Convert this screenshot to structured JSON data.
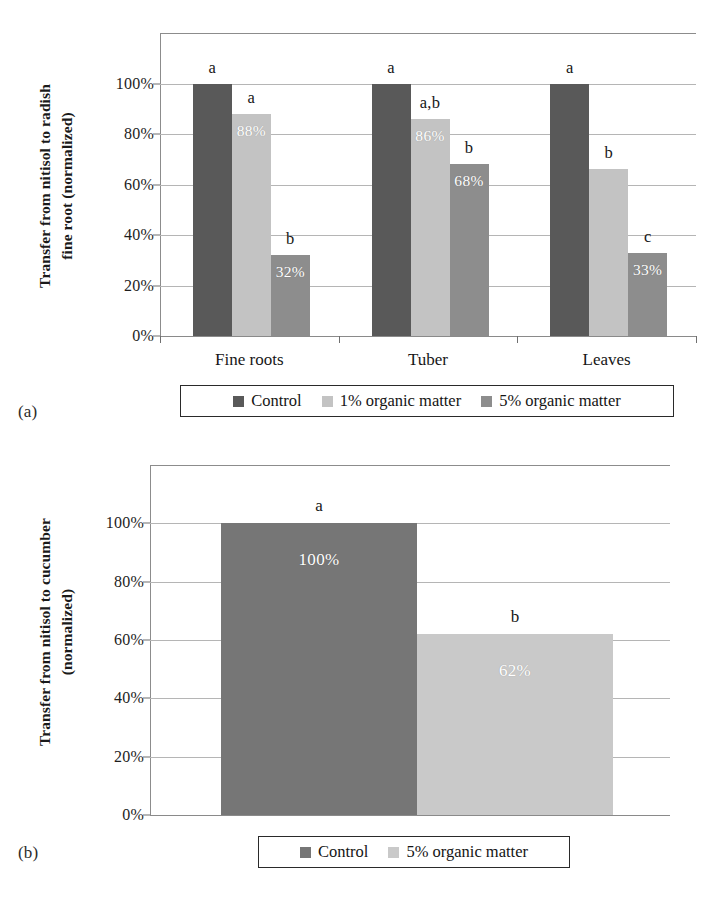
{
  "figure": {
    "panels": [
      {
        "tag": "(a)"
      },
      {
        "tag": "(b)"
      }
    ]
  },
  "panel_a": {
    "tag": "(a)",
    "y_axis_title": "Transfer from nitisol to radish\nfine root (normalized)",
    "y_ticks": [
      "100%",
      "80%",
      "60%",
      "40%",
      "20%",
      "0%"
    ],
    "categories": [
      "Fine roots",
      "Tuber",
      "Leaves"
    ],
    "legend": [
      {
        "label": "Control",
        "color": "#595959"
      },
      {
        "label": "1% organic matter",
        "color": "#c3c3c3"
      },
      {
        "label": "5% organic matter",
        "color": "#8d8d8d"
      }
    ],
    "bars": [
      {
        "group": "Fine roots",
        "series": "Control",
        "value": 100,
        "value_label": "",
        "sig": "a"
      },
      {
        "group": "Fine roots",
        "series": "1% organic matter",
        "value": 88,
        "value_label": "88%",
        "sig": "a"
      },
      {
        "group": "Fine roots",
        "series": "5% organic matter",
        "value": 32,
        "value_label": "32%",
        "sig": "b"
      },
      {
        "group": "Tuber",
        "series": "Control",
        "value": 100,
        "value_label": "",
        "sig": "a"
      },
      {
        "group": "Tuber",
        "series": "1% organic matter",
        "value": 86,
        "value_label": "86%",
        "sig": "a,b"
      },
      {
        "group": "Tuber",
        "series": "5% organic matter",
        "value": 68,
        "value_label": "68%",
        "sig": "b"
      },
      {
        "group": "Leaves",
        "series": "Control",
        "value": 100,
        "value_label": "",
        "sig": "a"
      },
      {
        "group": "Leaves",
        "series": "1% organic matter",
        "value": 66,
        "value_label": "",
        "sig": "b"
      },
      {
        "group": "Leaves",
        "series": "5% organic matter",
        "value": 33,
        "value_label": "33%",
        "sig": "c"
      }
    ]
  },
  "panel_b": {
    "tag": "(b)",
    "y_axis_title": "Transfer from nitisol to cucumber\n(normalized)",
    "y_ticks": [
      "100%",
      "80%",
      "60%",
      "40%",
      "20%",
      "0%"
    ],
    "legend": [
      {
        "label": "Control",
        "color": "#767676"
      },
      {
        "label": "5% organic matter",
        "color": "#c9c9c9"
      }
    ],
    "bars": [
      {
        "series": "Control",
        "value": 100,
        "value_label": "100%",
        "sig": "a"
      },
      {
        "series": "5% organic matter",
        "value": 62,
        "value_label": "62%",
        "sig": "b"
      }
    ]
  },
  "chart_data": [
    {
      "type": "bar",
      "panel": "(a)",
      "title": "",
      "xlabel": "",
      "ylabel": "Transfer from nitisol to radish fine root (normalized)",
      "categories": [
        "Fine roots",
        "Tuber",
        "Leaves"
      ],
      "series": [
        {
          "name": "Control",
          "values": [
            100,
            100,
            100
          ],
          "color": "#595959",
          "data_labels": [
            "",
            "",
            ""
          ]
        },
        {
          "name": "1% organic matter",
          "values": [
            88,
            86,
            66
          ],
          "color": "#c3c3c3",
          "data_labels": [
            "88%",
            "86%",
            ""
          ]
        },
        {
          "name": "5% organic matter",
          "values": [
            32,
            68,
            33
          ],
          "color": "#8d8d8d",
          "data_labels": [
            "32%",
            "68%",
            "33%"
          ]
        }
      ],
      "significance_letters": [
        {
          "series": "Control",
          "letters": [
            "a",
            "a",
            "a"
          ]
        },
        {
          "series": "1% organic matter",
          "letters": [
            "a",
            "a,b",
            "b"
          ]
        },
        {
          "series": "5% organic matter",
          "letters": [
            "b",
            "b",
            "c"
          ]
        }
      ],
      "ylim": [
        0,
        120
      ],
      "yticks": [
        0,
        20,
        40,
        60,
        80,
        100
      ],
      "ytick_labels": [
        "0%",
        "20%",
        "40%",
        "60%",
        "80%",
        "100%"
      ],
      "grid": true,
      "legend_position": "bottom"
    },
    {
      "type": "bar",
      "panel": "(b)",
      "title": "",
      "xlabel": "",
      "ylabel": "Transfer from nitisol to cucumber (normalized)",
      "categories": [
        "Control",
        "5% organic matter"
      ],
      "values": [
        100,
        62
      ],
      "data_labels": [
        "100%",
        "62%"
      ],
      "colors": [
        "#767676",
        "#c9c9c9"
      ],
      "significance_letters": [
        "a",
        "b"
      ],
      "ylim": [
        0,
        120
      ],
      "yticks": [
        0,
        20,
        40,
        60,
        80,
        100
      ],
      "ytick_labels": [
        "0%",
        "20%",
        "40%",
        "60%",
        "80%",
        "100%"
      ],
      "grid": true,
      "legend_position": "bottom"
    }
  ]
}
